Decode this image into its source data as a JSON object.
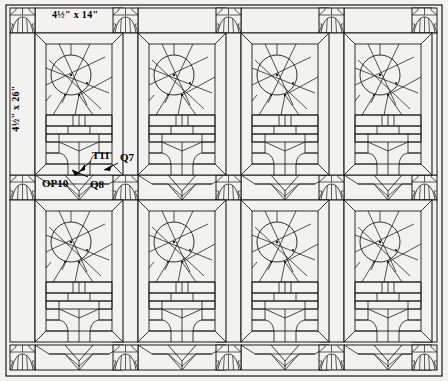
{
  "drawing": {
    "title": "Stained glass window panel layout",
    "background_color": "#f2f2f0",
    "line_color": "#1a1a1a",
    "dimensions": {
      "top_label": "4½\" x 14\"",
      "left_label": "4½\" x 26\""
    },
    "part_labels": [
      {
        "id": "T11",
        "text": "T11"
      },
      {
        "id": "Q7",
        "text": "Q7"
      },
      {
        "id": "OP10",
        "text": "OP10"
      },
      {
        "id": "Q8",
        "text": "Q8"
      }
    ],
    "grid": {
      "columns": 4,
      "rows": 2,
      "panel_count": 8,
      "corner_block_columns": [
        10,
        112,
        215,
        318,
        420
      ],
      "corner_block_rows": [
        8,
        175,
        345
      ]
    }
  }
}
